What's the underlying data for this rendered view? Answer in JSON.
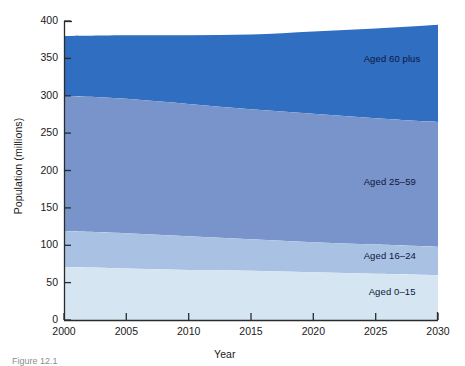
{
  "figure": {
    "background": "#ffffff",
    "caption_fragment": "Figure 12.1"
  },
  "chart_data": {
    "type": "area",
    "stacked": true,
    "title": "",
    "xlabel": "Year",
    "ylabel": "Population (millions)",
    "xlim": [
      2000,
      2030
    ],
    "ylim": [
      0,
      400
    ],
    "grid": false,
    "legend_position": "inline-right",
    "xticks": [
      2000,
      2005,
      2010,
      2015,
      2020,
      2025,
      2030
    ],
    "yticks": [
      0,
      50,
      100,
      150,
      200,
      250,
      300,
      350,
      400
    ],
    "x": [
      2000,
      2005,
      2010,
      2015,
      2020,
      2025,
      2030
    ],
    "series": [
      {
        "name": "Aged 0–15",
        "color": "#d5e5f2",
        "values": [
          71,
          69,
          67,
          66,
          64,
          62,
          60
        ]
      },
      {
        "name": "Aged 16–24",
        "color": "#a9c2e4",
        "values": [
          48,
          47,
          45,
          42,
          40,
          39,
          38
        ]
      },
      {
        "name": "Aged 25–59",
        "color": "#7894ca",
        "values": [
          181,
          180,
          177,
          174,
          172,
          169,
          167
        ]
      },
      {
        "name": "Aged 60 plus",
        "color": "#2f6ec0",
        "values": [
          80,
          85,
          92,
          100,
          110,
          120,
          130
        ]
      }
    ],
    "cumulative_tops": {
      "Aged 0–15": [
        71,
        69,
        67,
        66,
        64,
        62,
        60
      ],
      "Aged 16–24": [
        119,
        116,
        112,
        108,
        104,
        101,
        98
      ],
      "Aged 25–59": [
        300,
        296,
        289,
        282,
        276,
        270,
        265
      ],
      "Aged 60 plus": [
        380,
        381,
        384,
        387,
        390,
        392,
        395
      ]
    },
    "annotations": [
      {
        "text": "Aged 60 plus",
        "x": 2024.2,
        "y": 349
      },
      {
        "text": "Aged 25–59",
        "x": 2024.2,
        "y": 184
      },
      {
        "text": "Aged 16–24",
        "x": 2024.2,
        "y": 85
      },
      {
        "text": "Aged 0–15",
        "x": 2024.6,
        "y": 37
      }
    ]
  },
  "axes": {
    "y_tick_labels": [
      "400",
      "350",
      "300",
      "250",
      "200",
      "150",
      "100",
      "50",
      "0"
    ],
    "x_tick_labels": [
      "2000",
      "2005",
      "2010",
      "2015",
      "2020",
      "2025",
      "2030"
    ],
    "x_title": "Year",
    "y_title": "Population (millions)"
  },
  "colors": {
    "axis": "#2b2b2b",
    "text": "#1a1a1a",
    "band_0_15": "#d5e5f2",
    "band_16_24": "#a9c2e4",
    "band_25_59": "#7894ca",
    "band_60_plus": "#2f6ec0"
  }
}
